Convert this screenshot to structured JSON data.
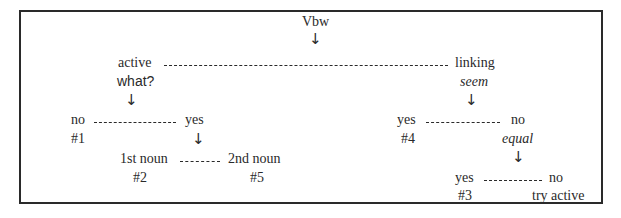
{
  "diagram": {
    "root": {
      "label": "Vbw"
    },
    "level1": {
      "left": {
        "label": "active",
        "question": "what?"
      },
      "right": {
        "label": "linking",
        "question": "seem"
      }
    },
    "active_branch": {
      "no": {
        "label": "no",
        "ref": "#1"
      },
      "yes": {
        "label": "yes"
      },
      "first_noun": {
        "label": "1st noun",
        "ref": "#2"
      },
      "second_noun": {
        "label": "2nd noun",
        "ref": "#5"
      }
    },
    "linking_branch": {
      "yes": {
        "label": "yes",
        "ref": "#4"
      },
      "no": {
        "label": "no",
        "question": "equal"
      },
      "equal_yes": {
        "label": "yes",
        "ref": "#3"
      },
      "equal_no": {
        "label": "no",
        "note": "try active"
      }
    },
    "arrow_glyph": "↓"
  }
}
